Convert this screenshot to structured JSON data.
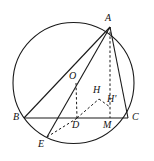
{
  "figure": {
    "type": "geometry-diagram",
    "canvas": {
      "width": 154,
      "height": 161,
      "background": "#ffffff"
    },
    "style": {
      "stroke_color": "#1a1a1a",
      "solid_width": 1,
      "dashed_width": 1,
      "dash_pattern": "2.5,2.2",
      "label_color": "#111111"
    },
    "circle": {
      "name": "circumcircle",
      "cx": 73.5,
      "cy": 83,
      "r": 60.5
    },
    "points": [
      {
        "id": "A",
        "label": "A",
        "x": 110,
        "y": 27,
        "label_x": 105,
        "label_y": 13
      },
      {
        "id": "B",
        "label": "B",
        "x": 24,
        "y": 118,
        "label_x": 13,
        "label_y": 112
      },
      {
        "id": "C",
        "label": "C",
        "x": 128,
        "y": 118,
        "label_x": 132,
        "label_y": 112
      },
      {
        "id": "O",
        "label": "O",
        "x": 76,
        "y": 83,
        "label_x": 69,
        "label_y": 71
      },
      {
        "id": "D",
        "label": "D",
        "x": 77,
        "y": 118,
        "label_x": 72,
        "label_y": 120
      },
      {
        "id": "M",
        "label": "M",
        "x": 110,
        "y": 118,
        "label_x": 103,
        "label_y": 120
      },
      {
        "id": "E",
        "label": "E",
        "x": 47,
        "y": 137,
        "label_x": 38,
        "label_y": 139
      },
      {
        "id": "H",
        "label": "H",
        "x": 99,
        "y": 99,
        "label_x": 93,
        "label_y": 85
      },
      {
        "id": "Hprime",
        "label": "H'",
        "x": 110,
        "y": 107,
        "label_x": 107,
        "label_y": 94
      }
    ],
    "solid_segments": [
      {
        "name": "segment-BC",
        "from": "B",
        "to": "C"
      },
      {
        "name": "segment-AB",
        "from": "A",
        "to": "B"
      },
      {
        "name": "segment-AC",
        "from": "A",
        "to": "C"
      },
      {
        "name": "segment-AE",
        "from": "A",
        "to": "E"
      }
    ],
    "dashed_segments": [
      {
        "name": "segment-AM-altitude",
        "from": "A",
        "to": "M"
      },
      {
        "name": "segment-OD",
        "from": "O",
        "to": "D"
      },
      {
        "name": "segment-DH",
        "from": "D",
        "to": "H"
      },
      {
        "name": "segment-ED",
        "from": "E",
        "to": "D"
      },
      {
        "name": "segment-HHprime",
        "from": "H",
        "to": "Hprime"
      }
    ]
  }
}
